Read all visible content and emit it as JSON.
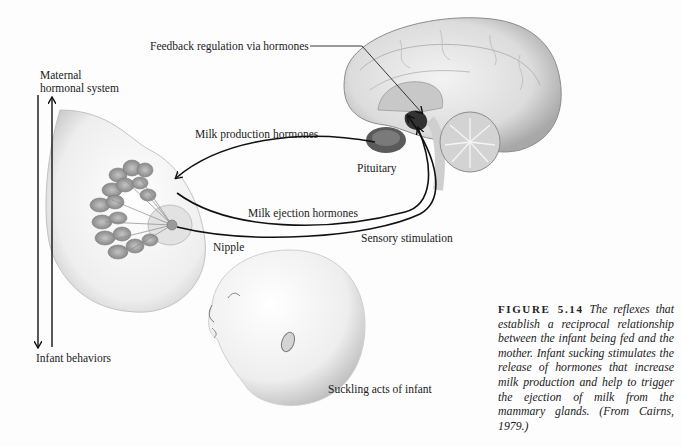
{
  "figure": {
    "number_label": "FIGURE 5.14",
    "caption_text": "The reflexes that establish a reciprocal relationship between the infant being fed and the mother. Infant sucking stimulates the release of hormones that increase milk production and help to trigger the ejection of milk from the mammary glands. (From Cairns, 1979.)"
  },
  "labels": {
    "feedback": "Feedback regulation via hormones",
    "maternal_line1": "Maternal",
    "maternal_line2": "hormonal system",
    "infant_behaviors": "Infant behaviors",
    "milk_production": "Milk production hormones",
    "milk_ejection": "Milk ejection hormones",
    "sensory": "Sensory stimulation",
    "pituitary": "Pituitary",
    "nipple": "Nipple",
    "suckling": "Suckling acts of infant"
  },
  "illustrations": [
    "brain-sagittal-section",
    "breast-mammary-glands",
    "infant-head"
  ],
  "colors": {
    "ink": "#1a1a1a",
    "paper": "#fdfdfd",
    "shade": "#9a9a9a"
  }
}
